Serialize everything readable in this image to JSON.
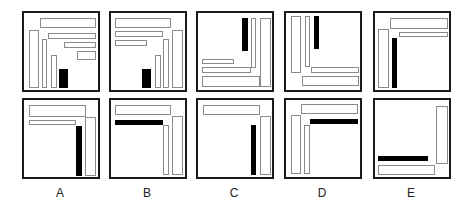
{
  "figure": {
    "colors": {
      "frame": "#1a1a1a",
      "outline": "#8a8a8a",
      "solid": "#000000",
      "background": "#ffffff"
    },
    "columns": [
      {
        "label": "A",
        "x": 22
      },
      {
        "label": "B",
        "x": 109
      },
      {
        "label": "C",
        "x": 196
      },
      {
        "label": "D",
        "x": 284
      },
      {
        "label": "E",
        "x": 373
      }
    ],
    "rows": [
      {
        "y": 11
      },
      {
        "y": 98
      }
    ],
    "panels": [
      {
        "id": "A-top",
        "row": 0,
        "col": 0,
        "shapes": [
          {
            "t": "o",
            "x": 16,
            "y": 5,
            "w": 56,
            "h": 10
          },
          {
            "t": "o",
            "x": 5,
            "y": 17,
            "w": 10,
            "h": 58
          },
          {
            "t": "o",
            "x": 18,
            "y": 26,
            "w": 5,
            "h": 49
          },
          {
            "t": "o",
            "x": 24,
            "y": 20,
            "w": 48,
            "h": 6
          },
          {
            "t": "o",
            "x": 40,
            "y": 29,
            "w": 32,
            "h": 6
          },
          {
            "t": "o",
            "x": 53,
            "y": 38,
            "w": 19,
            "h": 9
          },
          {
            "t": "o",
            "x": 27,
            "y": 42,
            "w": 6,
            "h": 33
          },
          {
            "t": "s",
            "x": 35,
            "y": 56,
            "w": 9,
            "h": 19
          }
        ]
      },
      {
        "id": "B-top",
        "row": 0,
        "col": 1,
        "shapes": [
          {
            "t": "o",
            "x": 4,
            "y": 5,
            "w": 56,
            "h": 10
          },
          {
            "t": "o",
            "x": 4,
            "y": 18,
            "w": 48,
            "h": 6
          },
          {
            "t": "o",
            "x": 4,
            "y": 27,
            "w": 32,
            "h": 6
          },
          {
            "t": "o",
            "x": 61,
            "y": 17,
            "w": 11,
            "h": 58
          },
          {
            "t": "o",
            "x": 52,
            "y": 26,
            "w": 6,
            "h": 49
          },
          {
            "t": "o",
            "x": 44,
            "y": 42,
            "w": 6,
            "h": 33
          },
          {
            "t": "s",
            "x": 31,
            "y": 56,
            "w": 9,
            "h": 19
          }
        ]
      },
      {
        "id": "C-top",
        "row": 0,
        "col": 2,
        "shapes": [
          {
            "t": "s",
            "x": 44,
            "y": 5,
            "w": 6,
            "h": 33
          },
          {
            "t": "o",
            "x": 53,
            "y": 5,
            "w": 5,
            "h": 50
          },
          {
            "t": "o",
            "x": 62,
            "y": 5,
            "w": 11,
            "h": 69
          },
          {
            "t": "o",
            "x": 4,
            "y": 46,
            "w": 32,
            "h": 5
          },
          {
            "t": "o",
            "x": 4,
            "y": 54,
            "w": 49,
            "h": 6
          },
          {
            "t": "o",
            "x": 4,
            "y": 63,
            "w": 58,
            "h": 11
          }
        ]
      },
      {
        "id": "D-top",
        "row": 0,
        "col": 3,
        "shapes": [
          {
            "t": "o",
            "x": 5,
            "y": 3,
            "w": 10,
            "h": 57
          },
          {
            "t": "o",
            "x": 19,
            "y": 3,
            "w": 5,
            "h": 51
          },
          {
            "t": "s",
            "x": 28,
            "y": 3,
            "w": 5,
            "h": 33
          },
          {
            "t": "o",
            "x": 25,
            "y": 54,
            "w": 48,
            "h": 6
          },
          {
            "t": "o",
            "x": 16,
            "y": 63,
            "w": 57,
            "h": 10
          }
        ]
      },
      {
        "id": "E-top",
        "row": 0,
        "col": 4,
        "shapes": [
          {
            "t": "o",
            "x": 15,
            "y": 5,
            "w": 58,
            "h": 11
          },
          {
            "t": "o",
            "x": 24,
            "y": 19,
            "w": 49,
            "h": 5
          },
          {
            "t": "o",
            "x": 3,
            "y": 16,
            "w": 11,
            "h": 59
          },
          {
            "t": "s",
            "x": 17,
            "y": 25,
            "w": 5,
            "h": 50
          }
        ]
      },
      {
        "id": "A-bottom",
        "row": 1,
        "col": 0,
        "shapes": [
          {
            "t": "o",
            "x": 5,
            "y": 5,
            "w": 57,
            "h": 12
          },
          {
            "t": "o",
            "x": 5,
            "y": 20,
            "w": 47,
            "h": 5
          },
          {
            "t": "o",
            "x": 61,
            "y": 17,
            "w": 11,
            "h": 59
          },
          {
            "t": "s",
            "x": 52,
            "y": 26,
            "w": 6,
            "h": 50
          }
        ]
      },
      {
        "id": "B-bottom",
        "row": 1,
        "col": 1,
        "shapes": [
          {
            "t": "o",
            "x": 4,
            "y": 5,
            "w": 56,
            "h": 10
          },
          {
            "t": "s",
            "x": 4,
            "y": 20,
            "w": 48,
            "h": 5
          },
          {
            "t": "o",
            "x": 52,
            "y": 25,
            "w": 6,
            "h": 50
          },
          {
            "t": "o",
            "x": 61,
            "y": 16,
            "w": 11,
            "h": 59
          }
        ]
      },
      {
        "id": "C-bottom",
        "row": 1,
        "col": 2,
        "shapes": [
          {
            "t": "o",
            "x": 5,
            "y": 5,
            "w": 57,
            "h": 10
          },
          {
            "t": "o",
            "x": 62,
            "y": 16,
            "w": 11,
            "h": 59
          },
          {
            "t": "s",
            "x": 53,
            "y": 25,
            "w": 5,
            "h": 50
          }
        ]
      },
      {
        "id": "D-bottom",
        "row": 1,
        "col": 3,
        "shapes": [
          {
            "t": "o",
            "x": 15,
            "y": 4,
            "w": 57,
            "h": 10
          },
          {
            "t": "s",
            "x": 24,
            "y": 19,
            "w": 48,
            "h": 5
          },
          {
            "t": "o",
            "x": 5,
            "y": 15,
            "w": 10,
            "h": 59
          },
          {
            "t": "o",
            "x": 18,
            "y": 25,
            "w": 6,
            "h": 49
          }
        ]
      },
      {
        "id": "E-bottom",
        "row": 1,
        "col": 4,
        "shapes": [
          {
            "t": "o",
            "x": 61,
            "y": 6,
            "w": 12,
            "h": 58
          },
          {
            "t": "s",
            "x": 3,
            "y": 56,
            "w": 50,
            "h": 5
          },
          {
            "t": "o",
            "x": 3,
            "y": 65,
            "w": 57,
            "h": 10
          }
        ]
      }
    ]
  }
}
